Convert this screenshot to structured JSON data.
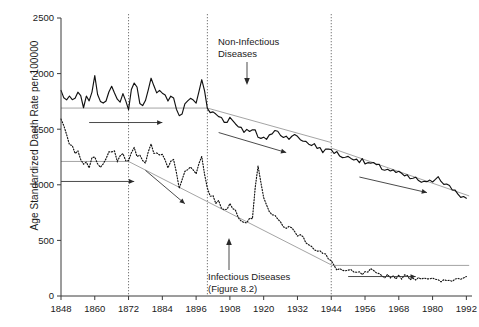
{
  "axes": {
    "ylabel": "Age Standardized Daeth Rate per 100000",
    "yticks": [
      "0",
      "500",
      "1000",
      "1500",
      "2000",
      "2500"
    ],
    "xticks": [
      "1848",
      "1860",
      "1872",
      "1884",
      "1896",
      "1908",
      "1920",
      "1932",
      "1944",
      "1956",
      "1968",
      "1980",
      "1992"
    ]
  },
  "annotations": {
    "noninfectious_line1": "Non-Infectious",
    "noninfectious_line2": "Diseases",
    "infectious_line1": "Infectious Diseases",
    "infectious_line2": "(Figure 8.2)"
  },
  "chart_data": {
    "type": "line",
    "title": "",
    "xlabel": "",
    "ylabel": "Age Standardized Daeth Rate per 100000",
    "xlim": [
      1848,
      1994
    ],
    "ylim": [
      0,
      2500
    ],
    "grid": false,
    "legend": "none",
    "xtick_values": [
      1848,
      1860,
      1872,
      1884,
      1896,
      1908,
      1920,
      1932,
      1944,
      1956,
      1968,
      1980,
      1992
    ],
    "ytick_values": [
      0,
      500,
      1000,
      1500,
      2000,
      2500
    ],
    "era_dividers": [
      1872,
      1900,
      1944
    ],
    "series": [
      {
        "name": "Non-Infectious Diseases",
        "style": "solid",
        "x": [
          1848,
          1850,
          1852,
          1854,
          1856,
          1858,
          1860,
          1862,
          1864,
          1866,
          1868,
          1870,
          1872,
          1874,
          1876,
          1878,
          1880,
          1882,
          1884,
          1886,
          1888,
          1890,
          1892,
          1894,
          1896,
          1898,
          1900,
          1902,
          1904,
          1906,
          1908,
          1910,
          1912,
          1914,
          1916,
          1918,
          1920,
          1922,
          1924,
          1926,
          1928,
          1930,
          1932,
          1934,
          1936,
          1938,
          1940,
          1942,
          1944,
          1946,
          1948,
          1950,
          1952,
          1954,
          1956,
          1958,
          1960,
          1962,
          1964,
          1966,
          1968,
          1970,
          1972,
          1974,
          1976,
          1978,
          1980,
          1982,
          1984,
          1986,
          1988,
          1990,
          1992
        ],
        "y": [
          1840,
          1760,
          1750,
          1800,
          1730,
          1780,
          1940,
          1760,
          1790,
          1850,
          1750,
          1810,
          1700,
          1950,
          1760,
          1740,
          1930,
          1800,
          1860,
          1780,
          1790,
          1600,
          1700,
          1800,
          1730,
          1960,
          1680,
          1640,
          1620,
          1580,
          1600,
          1550,
          1520,
          1480,
          1520,
          1420,
          1400,
          1450,
          1480,
          1460,
          1430,
          1450,
          1420,
          1400,
          1380,
          1350,
          1330,
          1300,
          1320,
          1280,
          1260,
          1240,
          1250,
          1220,
          1200,
          1190,
          1170,
          1150,
          1140,
          1120,
          1100,
          1080,
          1060,
          1050,
          1030,
          1010,
          1040,
          1080,
          1020,
          980,
          950,
          900,
          880
        ]
      },
      {
        "name": "Infectious Diseases",
        "style": "dotted",
        "x": [
          1848,
          1850,
          1852,
          1854,
          1856,
          1858,
          1860,
          1862,
          1864,
          1866,
          1868,
          1870,
          1872,
          1874,
          1876,
          1878,
          1880,
          1882,
          1884,
          1886,
          1888,
          1890,
          1892,
          1894,
          1896,
          1898,
          1900,
          1902,
          1904,
          1906,
          1908,
          1910,
          1912,
          1914,
          1916,
          1918,
          1920,
          1922,
          1924,
          1926,
          1928,
          1930,
          1932,
          1934,
          1936,
          1938,
          1940,
          1942,
          1944,
          1946,
          1948,
          1950,
          1952,
          1954,
          1956,
          1958,
          1960,
          1962,
          1964,
          1966,
          1968,
          1970,
          1972,
          1974,
          1976,
          1978,
          1980,
          1982,
          1984,
          1986,
          1988,
          1990,
          1992
        ],
        "y": [
          1580,
          1420,
          1340,
          1280,
          1200,
          1180,
          1260,
          1150,
          1230,
          1300,
          1240,
          1270,
          1210,
          1330,
          1240,
          1200,
          1350,
          1260,
          1300,
          1180,
          1210,
          1000,
          1100,
          1180,
          1120,
          1250,
          960,
          880,
          830,
          790,
          820,
          760,
          700,
          680,
          720,
          1180,
          900,
          760,
          700,
          660,
          620,
          600,
          560,
          520,
          480,
          430,
          400,
          360,
          300,
          250,
          230,
          220,
          210,
          200,
          200,
          230,
          190,
          180,
          185,
          175,
          170,
          175,
          165,
          160,
          170,
          165,
          150,
          130,
          135,
          140,
          150,
          165,
          175
        ]
      }
    ],
    "trend_lines": [
      {
        "name": "noninfectious-era1-flat",
        "x": [
          1848,
          1900
        ],
        "y": [
          1690,
          1690
        ]
      },
      {
        "name": "noninfectious-era2-decline",
        "x": [
          1900,
          1944
        ],
        "y": [
          1690,
          1380
        ]
      },
      {
        "name": "noninfectious-era3-decline",
        "x": [
          1944,
          1993
        ],
        "y": [
          1330,
          900
        ]
      },
      {
        "name": "infectious-era1-flat",
        "x": [
          1848,
          1872
        ],
        "y": [
          1210,
          1210
        ]
      },
      {
        "name": "infectious-era2-decline",
        "x": [
          1872,
          1944
        ],
        "y": [
          1210,
          280
        ]
      },
      {
        "name": "infectious-era3-flat",
        "x": [
          1944,
          1993
        ],
        "y": [
          275,
          275
        ]
      }
    ],
    "trend_arrows": [
      {
        "name": "era1-noninfectious-arrow",
        "x1": 1858,
        "y1": 1560,
        "x2": 1884,
        "y2": 1560
      },
      {
        "name": "era1-infectious-arrow",
        "x1": 1848,
        "y1": 1030,
        "x2": 1874,
        "y2": 1030
      },
      {
        "name": "era2-infectious-arrow",
        "x1": 1878,
        "y1": 1130,
        "x2": 1892,
        "y2": 830
      },
      {
        "name": "era2-noninfectious-arrow",
        "x1": 1904,
        "y1": 1470,
        "x2": 1928,
        "y2": 1290
      },
      {
        "name": "era3-noninfectious-arrow",
        "x1": 1954,
        "y1": 1070,
        "x2": 1978,
        "y2": 930
      },
      {
        "name": "era3-infectious-arrow",
        "x1": 1950,
        "y1": 175,
        "x2": 1974,
        "y2": 175
      }
    ]
  }
}
